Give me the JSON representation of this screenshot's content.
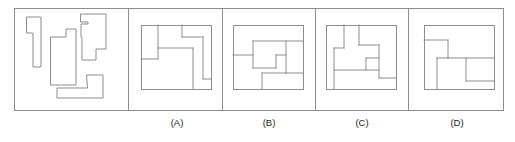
{
  "figure": {
    "type": "spatial-reasoning-puzzle",
    "outer_frame": {
      "x": 14,
      "y": 8,
      "width": 489,
      "height": 102
    },
    "panel_dividers_x": [
      128,
      222,
      315,
      408
    ],
    "stroke_color": "#8d8d8d",
    "label_color": "#1a1a1a",
    "background_color": "#ffffff"
  },
  "stimulus_panel": {
    "name": "loose-pieces",
    "piece_count": 4,
    "pieces": [
      {
        "id": "piece-1",
        "name": "narrow-hook-piece",
        "points": "27,17 41,17 41,67 33,67 33,33 27,33"
      },
      {
        "id": "piece-2",
        "name": "large-notched-block-piece",
        "points": "51,37 66,37 66,29 76,29 76,85 51,85"
      },
      {
        "id": "piece-3",
        "name": "tall-zigzag-piece",
        "points": "81,14 106,14 106,49 96,49 96,60 82,60 82,37 81,37 81,24 88,24 88,22 81,22"
      },
      {
        "id": "piece-4",
        "name": "low-step-piece",
        "points": "87,75 103,75 103,88 103,98 57,98 57,88 87,88"
      }
    ]
  },
  "options": [
    {
      "id": "option-a",
      "label": "(A)",
      "label_x": 177,
      "label_y": 126,
      "box": {
        "x": 141,
        "y": 25,
        "width": 70,
        "height": 64
      },
      "inner_lines": [
        {
          "name": "a-line-1",
          "d": "M 158 25 L 158 59"
        },
        {
          "name": "a-line-2",
          "d": "M 141 59 L 158 59"
        },
        {
          "name": "a-line-3",
          "d": "M 158 48 L 193 48"
        },
        {
          "name": "a-line-4",
          "d": "M 193 48 L 193 89"
        },
        {
          "name": "a-line-5",
          "d": "M 182 25 L 182 37"
        },
        {
          "name": "a-line-6",
          "d": "M 182 37 L 203 37"
        },
        {
          "name": "a-line-7",
          "d": "M 203 37 L 203 79"
        },
        {
          "name": "a-line-8",
          "d": "M 203 79 L 211 79"
        }
      ]
    },
    {
      "id": "option-b",
      "label": "(B)",
      "label_x": 269,
      "label_y": 126,
      "box": {
        "x": 233,
        "y": 25,
        "width": 70,
        "height": 64
      },
      "inner_lines": [
        {
          "name": "b-line-1",
          "d": "M 233 55 L 253 55"
        },
        {
          "name": "b-line-2",
          "d": "M 253 41 L 253 68"
        },
        {
          "name": "b-line-3",
          "d": "M 253 41 L 303 41"
        },
        {
          "name": "b-line-4",
          "d": "M 253 68 L 276 68"
        },
        {
          "name": "b-line-5",
          "d": "M 276 55 L 276 68"
        },
        {
          "name": "b-line-6",
          "d": "M 276 55 L 286 55"
        },
        {
          "name": "b-line-7",
          "d": "M 286 41 L 286 73"
        },
        {
          "name": "b-line-8",
          "d": "M 286 73 L 303 73"
        },
        {
          "name": "b-line-9",
          "d": "M 262 73 L 262 89"
        },
        {
          "name": "b-line-10",
          "d": "M 262 73 L 286 73"
        }
      ]
    },
    {
      "id": "option-c",
      "label": "(C)",
      "label_x": 362,
      "label_y": 126,
      "box": {
        "x": 326,
        "y": 25,
        "width": 70,
        "height": 64
      },
      "inner_lines": [
        {
          "name": "c-line-1",
          "d": "M 344 25 L 344 48"
        },
        {
          "name": "c-line-2",
          "d": "M 334 48 L 344 48"
        },
        {
          "name": "c-line-3",
          "d": "M 334 48 L 334 89"
        },
        {
          "name": "c-line-4",
          "d": "M 334 70 L 379 70"
        },
        {
          "name": "c-line-5",
          "d": "M 359 25 L 359 45"
        },
        {
          "name": "c-line-6",
          "d": "M 359 45 L 379 45"
        },
        {
          "name": "c-line-7",
          "d": "M 379 45 L 379 78"
        },
        {
          "name": "c-line-8",
          "d": "M 379 78 L 396 78"
        },
        {
          "name": "c-line-9",
          "d": "M 366 58 L 366 70"
        },
        {
          "name": "c-line-10",
          "d": "M 366 58 L 379 58"
        }
      ]
    },
    {
      "id": "option-d",
      "label": "(D)",
      "label_x": 457,
      "label_y": 126,
      "box": {
        "x": 424,
        "y": 25,
        "width": 70,
        "height": 64
      },
      "inner_lines": [
        {
          "name": "d-line-1",
          "d": "M 424 40 L 448 40"
        },
        {
          "name": "d-line-2",
          "d": "M 448 40 L 448 58"
        },
        {
          "name": "d-line-3",
          "d": "M 448 58 L 494 58"
        },
        {
          "name": "d-line-4",
          "d": "M 437 58 L 448 58"
        },
        {
          "name": "d-line-5",
          "d": "M 437 58 L 437 89"
        },
        {
          "name": "d-line-6",
          "d": "M 466 58 L 466 81"
        },
        {
          "name": "d-line-7",
          "d": "M 466 81 L 494 81"
        }
      ]
    }
  ]
}
